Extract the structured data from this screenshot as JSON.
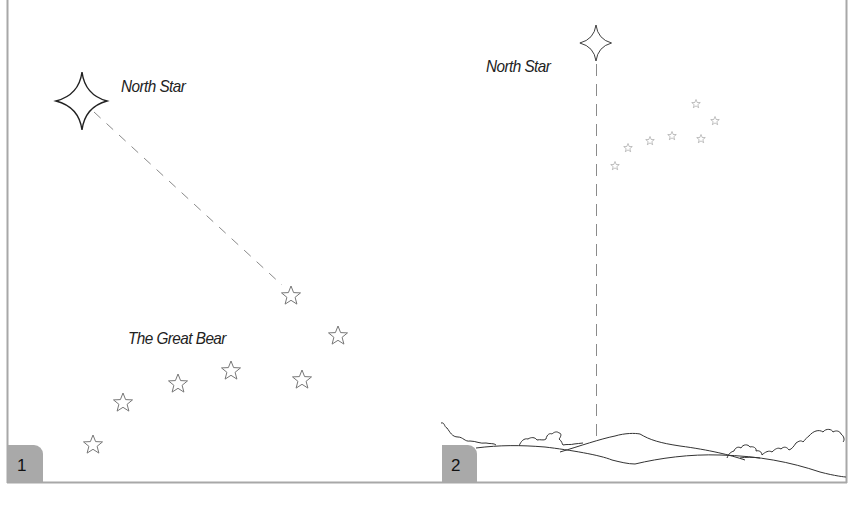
{
  "figure": {
    "panels": [
      {
        "number": "1",
        "north_star_label": "North Star",
        "constellation_label": "The Great Bear",
        "description": "Pointer stars of The Great Bear lead to the North Star"
      },
      {
        "number": "2",
        "north_star_label": "North Star",
        "description": "North Star directly above a point on the horizon"
      }
    ],
    "colors": {
      "badge": "#a9a9a9",
      "border": "#a8a8a8",
      "dash": "#888888",
      "ink": "#222222"
    }
  }
}
